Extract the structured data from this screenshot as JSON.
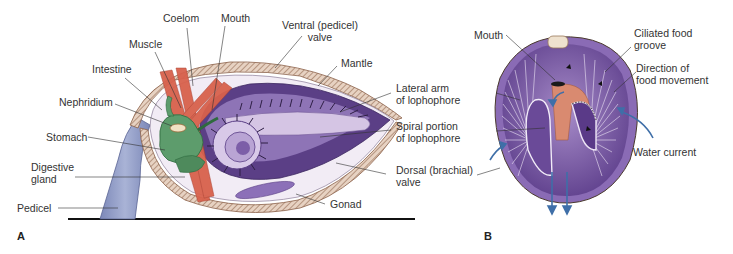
{
  "figure": {
    "panels": [
      {
        "letter": "A",
        "description": "Brachiopod internal anatomy, lateral section",
        "labels": {
          "coelom": "Coelom",
          "mouth": "Mouth",
          "muscle": "Muscle",
          "intestine": "Intestine",
          "nephridium": "Nephridium",
          "stomach": "Stomach",
          "digestive_gland_1": "Digestive",
          "digestive_gland_2": "gland",
          "pedicel": "Pedicel",
          "ventral_valve_1": "Ventral (pedicel)",
          "ventral_valve_2": "valve",
          "mantle": "Mantle",
          "lateral_arm_1": "Lateral arm",
          "lateral_arm_2": "of lophophore",
          "spiral_portion_1": "Spiral portion",
          "spiral_portion_2": "of lophophore",
          "dorsal_valve_1": "Dorsal (brachial)",
          "dorsal_valve_2": "valve",
          "gonad": "Gonad"
        }
      },
      {
        "letter": "B",
        "description": "Lophophore in dorsal view showing feeding currents",
        "labels": {
          "mouth": "Mouth",
          "ciliated_groove_1": "Ciliated food",
          "ciliated_groove_2": "groove",
          "direction_1": "Direction of",
          "direction_2": "food movement",
          "water_current": "Water current"
        }
      }
    ],
    "colors": {
      "shell": "#c9a98c",
      "mantle_cavity": "#e8dcee",
      "lophophore": "#7b5fa8",
      "lophophore_light": "#c9b6dd",
      "muscle": "#d9604a",
      "gut": "#5a9a6a",
      "pedicel": "#8f9bc4",
      "water_arrow": "#3f6fa8",
      "food_groove": "#d98a70",
      "leader_line": "#333333"
    }
  }
}
